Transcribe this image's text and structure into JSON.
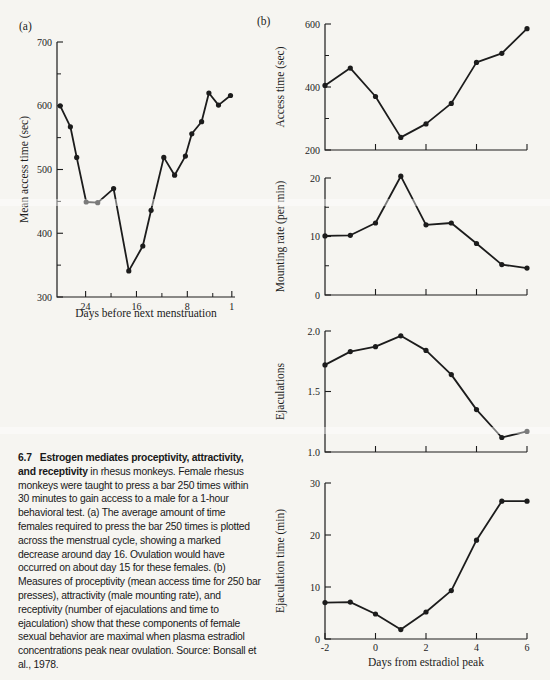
{
  "page": {
    "background": "#f6f5f1",
    "ink": "#1c1c1c"
  },
  "panel_a": {
    "label": "(a)"
  },
  "panel_b": {
    "label": "(b)"
  },
  "chart_data": [
    {
      "id": "panel-a-mean-access-time",
      "type": "line",
      "ylabel": "Mean access time (sec)",
      "xlabel": "Days before next menstruation",
      "xlim": [
        28.5,
        0.5
      ],
      "ylim": [
        300,
        700
      ],
      "yticks": [
        300,
        400,
        500,
        600,
        700
      ],
      "ytick_labels": [
        "300",
        "400",
        "500",
        "600",
        "700"
      ],
      "yticks_minor": [
        350,
        450,
        550,
        650
      ],
      "xticks": [
        24,
        16,
        8,
        1
      ],
      "xtick_labels": [
        "24",
        "16",
        "8",
        "1"
      ],
      "xticks_minor": [
        20,
        12,
        4
      ],
      "x": [
        28,
        26.4,
        25.4,
        23.9,
        22.1,
        19.6,
        17.2,
        15.0,
        13.7,
        11.7,
        10.0,
        8.3,
        7.3,
        5.75,
        4.6,
        3.1,
        1.2
      ],
      "values": [
        600,
        567,
        519,
        449,
        448,
        470,
        341,
        380,
        436,
        519,
        491,
        521,
        556,
        575,
        620,
        601,
        616
      ]
    },
    {
      "id": "panel-b-access-time",
      "type": "line",
      "ylabel": "Access time (sec)",
      "xlabel": "",
      "xlim": [
        -2,
        6
      ],
      "ylim": [
        200,
        600
      ],
      "yticks": [
        200,
        400,
        600
      ],
      "ytick_labels": [
        "200",
        "400",
        "600"
      ],
      "yticks_minor": [
        300,
        500
      ],
      "xticks": [
        0,
        2,
        4,
        6
      ],
      "xtick_labels": [],
      "xticks_minor": [],
      "x": [
        -2,
        -1,
        0,
        1,
        2,
        3,
        4,
        5,
        6
      ],
      "values": [
        405,
        460,
        370,
        240,
        283,
        348,
        478,
        507,
        585
      ]
    },
    {
      "id": "panel-b-mounting-rate",
      "type": "line",
      "ylabel": "Mounting rate (per min)",
      "xlabel": "",
      "xlim": [
        -2,
        6
      ],
      "ylim": [
        0,
        20
      ],
      "yticks": [
        0,
        10,
        20
      ],
      "ytick_labels": [
        "0",
        "10",
        "20"
      ],
      "yticks_minor": [
        5,
        15
      ],
      "xticks": [
        0,
        2,
        4,
        6
      ],
      "xtick_labels": [],
      "xticks_minor": [],
      "x": [
        -2,
        -1,
        0,
        1,
        2,
        3,
        4,
        5,
        6
      ],
      "values": [
        10.1,
        10.2,
        12.3,
        20.3,
        12.0,
        12.3,
        8.8,
        5.2,
        4.6
      ]
    },
    {
      "id": "panel-b-ejaculations",
      "type": "line",
      "ylabel": "Ejaculations",
      "xlabel": "",
      "xlim": [
        -2,
        6
      ],
      "ylim": [
        1.0,
        2.0
      ],
      "yticks": [
        1.0,
        1.5,
        2.0
      ],
      "ytick_labels": [
        "1.0",
        "1.5",
        "2.0"
      ],
      "yticks_minor": [],
      "xticks": [
        0,
        2,
        4,
        6
      ],
      "xtick_labels": [],
      "xticks_minor": [],
      "x": [
        -2,
        -1,
        0,
        1,
        2,
        3,
        4,
        5,
        6
      ],
      "values": [
        1.72,
        1.83,
        1.87,
        1.96,
        1.84,
        1.64,
        1.35,
        1.12,
        1.17
      ]
    },
    {
      "id": "panel-b-ejaculation-time",
      "type": "line",
      "ylabel": "Ejaculation time (min)",
      "xlabel": "Days from estradiol peak",
      "xlim": [
        -2,
        6
      ],
      "ylim": [
        0,
        30
      ],
      "yticks": [
        0,
        10,
        20,
        30
      ],
      "ytick_labels": [
        "0",
        "10",
        "20",
        "30"
      ],
      "yticks_minor": [],
      "xticks": [
        -2,
        0,
        2,
        4,
        6
      ],
      "xtick_labels": [
        "-2",
        "0",
        "2",
        "4",
        "6"
      ],
      "xticks_minor": [],
      "x": [
        -2,
        -1,
        0,
        1,
        2,
        3,
        4,
        5,
        6
      ],
      "values": [
        7.0,
        7.1,
        4.8,
        1.8,
        5.2,
        9.3,
        19.0,
        26.5,
        26.5
      ]
    }
  ],
  "caption": {
    "number": "6.7",
    "bold": "Estrogen mediates proceptivity, attractivity, and receptivity",
    "text": " in rhesus monkeys. Female rhesus monkeys were taught to press a bar 250 times within 30 minutes to gain access to a male for a 1-hour behavioral test. (a) The average amount of time females required to press the bar 250 times is plotted across the menstrual cycle, showing a marked decrease around day 16. Ovulation would have occurred on about day 15 for these females. (b) Measures of proceptivity (mean access time for 250 bar presses), attractivity (male mounting rate), and receptivity (number of ejaculations and time to ejaculation) show that these components of female sexual behavior are maximal when plasma estradiol concentrations peak near ovulation. Source: Bonsall et al., 1978."
  }
}
